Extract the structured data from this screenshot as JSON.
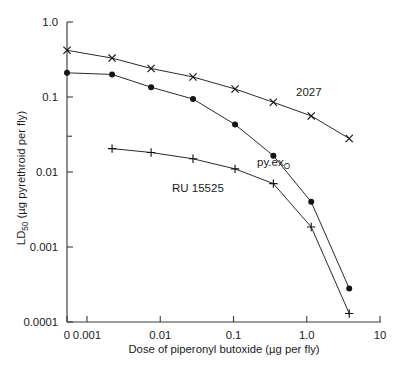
{
  "chart_data": {
    "type": "line",
    "title": "",
    "xlabel": "Dose of piperonyl butoxide (µg per fly)",
    "ylabel": "LD50 (µg pyrethroid per fly)",
    "ylabel_main": "LD",
    "ylabel_sub": "50",
    "ylabel_rest": " (µg pyrethroid per fly)",
    "xscale": "log-with-zero-break",
    "yscale": "log",
    "xlim": [
      0.001,
      10
    ],
    "ylim": [
      0.0001,
      1.0
    ],
    "grid": false,
    "legend": "inline-annotations",
    "x_tick_labels": [
      "0",
      "0.001",
      "0.01",
      "0.1",
      "1.0",
      "10"
    ],
    "x_tick_values": [
      0,
      0.001,
      0.01,
      0.1,
      1.0,
      10
    ],
    "y_tick_labels": [
      "1.0",
      "0.1",
      "0.01",
      "0.001",
      "0.0001"
    ],
    "y_tick_values": [
      1.0,
      0.1,
      0.01,
      0.001,
      0.0001
    ],
    "y_minor_tick_values": [
      0.03
    ],
    "series": [
      {
        "name": "2027",
        "label": "2027",
        "marker": "cross",
        "points": [
          {
            "x": 0,
            "y": 0.42
          },
          {
            "x": 0.0022,
            "y": 0.33
          },
          {
            "x": 0.0075,
            "y": 0.24
          },
          {
            "x": 0.028,
            "y": 0.185
          },
          {
            "x": 0.105,
            "y": 0.128
          },
          {
            "x": 0.35,
            "y": 0.085
          },
          {
            "x": 1.15,
            "y": 0.056
          },
          {
            "x": 3.8,
            "y": 0.028
          }
        ]
      },
      {
        "name": "py.ex_O",
        "label_main": "py.ex",
        "label_sub": "O",
        "marker": "dot",
        "points": [
          {
            "x": 0,
            "y": 0.21
          },
          {
            "x": 0.0022,
            "y": 0.2
          },
          {
            "x": 0.0075,
            "y": 0.135
          },
          {
            "x": 0.028,
            "y": 0.094
          },
          {
            "x": 0.105,
            "y": 0.043
          },
          {
            "x": 0.35,
            "y": 0.0165
          },
          {
            "x": 1.15,
            "y": 0.004
          },
          {
            "x": 3.8,
            "y": 0.00028
          }
        ]
      },
      {
        "name": "RU 15525",
        "label": "RU 15525",
        "marker": "plus",
        "points": [
          {
            "x": 0.0022,
            "y": 0.0205
          },
          {
            "x": 0.0075,
            "y": 0.0182
          },
          {
            "x": 0.028,
            "y": 0.015
          },
          {
            "x": 0.105,
            "y": 0.011
          },
          {
            "x": 0.35,
            "y": 0.007
          },
          {
            "x": 1.15,
            "y": 0.00185
          },
          {
            "x": 3.8,
            "y": 0.00013
          }
        ]
      }
    ],
    "annotations": [
      {
        "name": "label-2027",
        "text": "2027",
        "x": 296,
        "y": 96
      },
      {
        "name": "label-py-ex",
        "text": "py.ex",
        "sub": "O",
        "x": 257,
        "y": 166
      },
      {
        "name": "label-ru-15525",
        "text": "RU 15525",
        "x": 172,
        "y": 192
      }
    ],
    "colors": {
      "axis": "#3a3a3a",
      "line": "#2b2b2b",
      "marker": "#141414",
      "background": "#ffffff",
      "text": "#1a1a1a"
    }
  }
}
